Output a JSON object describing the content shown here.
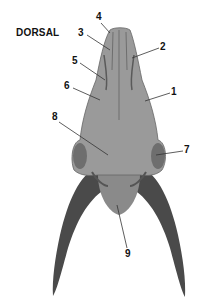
{
  "figure": {
    "view_title": "DORSAL",
    "colors": {
      "bone": "#9a9a9a",
      "bone_dark": "#6e6e6e",
      "horn": "#4a4a4a",
      "leader_line": "#333333",
      "label_text": "#111111"
    },
    "labels": [
      {
        "id": "1",
        "text": "1",
        "x": 171,
        "y": 87
      },
      {
        "id": "2",
        "text": "2",
        "x": 160,
        "y": 42
      },
      {
        "id": "3",
        "text": "3",
        "x": 78,
        "y": 28
      },
      {
        "id": "4",
        "text": "4",
        "x": 96,
        "y": 12
      },
      {
        "id": "5",
        "text": "5",
        "x": 72,
        "y": 56
      },
      {
        "id": "6",
        "text": "6",
        "x": 64,
        "y": 81
      },
      {
        "id": "7",
        "text": "7",
        "x": 184,
        "y": 145
      },
      {
        "id": "8",
        "text": "8",
        "x": 52,
        "y": 112
      },
      {
        "id": "9",
        "text": "9",
        "x": 125,
        "y": 249
      }
    ]
  }
}
